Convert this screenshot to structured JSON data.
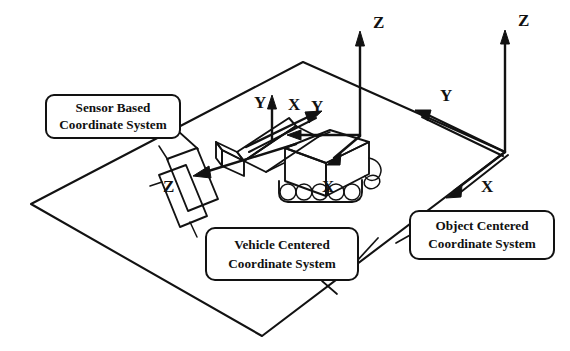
{
  "figure": {
    "background_color": "#ffffff",
    "ink_color": "#121212"
  },
  "callouts": [
    {
      "id": "sensor",
      "name": "sensor-based-coordinate-system-callout",
      "line1": "Sensor Based",
      "line2": "Coordinate System",
      "box": {
        "x": 46,
        "y": 95,
        "w": 134,
        "h": 43,
        "rx": 8
      },
      "leader": {
        "x1": 180,
        "y1": 130,
        "x2": 196,
        "y2": 145
      }
    },
    {
      "id": "vehicle",
      "name": "vehicle-centered-coordinate-system-callout",
      "line1": "Vehicle Centered",
      "line2": "Coordinate System",
      "box": {
        "x": 206,
        "y": 228,
        "w": 152,
        "h": 52,
        "rx": 8
      },
      "leader": {
        "x1": 358,
        "y1": 262,
        "x2": 378,
        "y2": 240
      }
    },
    {
      "id": "object",
      "name": "object-centered-coordinate-system-callout",
      "line1": "Object Centered",
      "line2": "Coordinate System",
      "box": {
        "x": 410,
        "y": 211,
        "w": 144,
        "h": 48,
        "rx": 8
      },
      "leader": {
        "x1": 410,
        "y1": 232,
        "x2": 396,
        "y2": 242
      }
    }
  ],
  "ground_plane": {
    "name": "ground-plane",
    "vertices": [
      {
        "x": 303,
        "y": 62
      },
      {
        "x": 505,
        "y": 152
      },
      {
        "x": 262,
        "y": 336
      },
      {
        "x": 31,
        "y": 204
      }
    ]
  },
  "coordinate_systems": [
    {
      "id": "vehicle-frame",
      "name": "vehicle-centered-frame",
      "origin": {
        "x": 360,
        "y": 136
      },
      "axes": [
        {
          "label": "Z",
          "label_x": 373,
          "label_y": 28,
          "tip_x": 360,
          "tip_y": 32
        },
        {
          "label": "Y",
          "label_x": 311,
          "label_y": 112,
          "tip_x": 289,
          "tip_y": 134
        },
        {
          "label": "X",
          "label_x": 322,
          "label_y": 192,
          "tip_x": 338,
          "tip_y": 163
        }
      ]
    },
    {
      "id": "object-frame",
      "name": "object-centered-frame",
      "origin": {
        "x": 505,
        "y": 152
      },
      "axes": [
        {
          "label": "Z",
          "label_x": 518,
          "label_y": 26,
          "tip_x": 505,
          "tip_y": 35
        },
        {
          "label": "Y",
          "label_x": 440,
          "label_y": 101,
          "tip_x": 421,
          "tip_y": 115
        },
        {
          "label": "X",
          "label_x": 481,
          "label_y": 192,
          "tip_x": 449,
          "tip_y": 194
        }
      ]
    },
    {
      "id": "sensor-frame",
      "name": "sensor-based-frame",
      "origin": {
        "x": 272,
        "y": 133
      },
      "axes": [
        {
          "label": "Y",
          "label_x": 254,
          "label_y": 108,
          "tip_x": 272,
          "tip_y": 96
        },
        {
          "label": "X",
          "label_x": 290,
          "label_y": 110,
          "tip_x": 319,
          "tip_y": 112
        },
        {
          "label": "Z",
          "label_x": 163,
          "label_y": 192,
          "tip_x": 193,
          "tip_y": 178
        }
      ]
    }
  ],
  "objects": [
    {
      "id": "vehicle",
      "name": "tracked-vehicle",
      "wheel_count": 5
    },
    {
      "id": "sensor",
      "name": "sensor-head"
    },
    {
      "id": "target",
      "name": "target-object-panel"
    }
  ]
}
